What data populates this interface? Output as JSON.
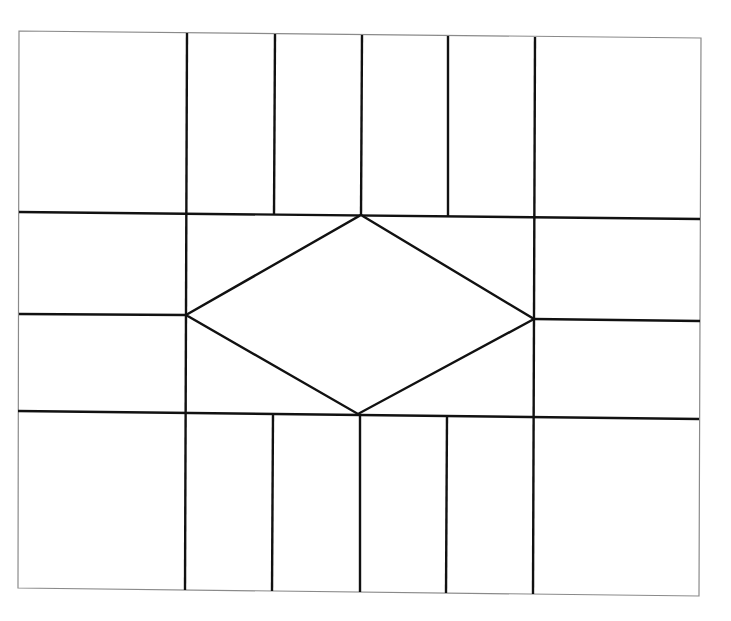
{
  "diagram": {
    "background": "#ffffff",
    "line_color": "#111111",
    "frame_color": "#8a8a8a",
    "frame": {
      "points": [
        [
          19,
          31
        ],
        [
          701,
          38
        ],
        [
          699,
          596
        ],
        [
          18,
          588
        ]
      ]
    },
    "horizontal_lines": [
      {
        "name": "upper-horizontal",
        "x1": 19,
        "y1": 212,
        "x2": 700,
        "y2": 219
      },
      {
        "name": "middle-left-horizontal",
        "x1": 19,
        "y1": 314,
        "x2": 186,
        "y2": 315
      },
      {
        "name": "middle-right-horizontal",
        "x1": 534,
        "y1": 319,
        "x2": 700,
        "y2": 321
      },
      {
        "name": "lower-horizontal",
        "x1": 18,
        "y1": 411,
        "x2": 699,
        "y2": 419
      }
    ],
    "vertical_lines": [
      {
        "name": "left-outer-vertical",
        "x1": 187,
        "y1": 33,
        "x2": 185,
        "y2": 590
      },
      {
        "name": "right-outer-vertical",
        "x1": 535,
        "y1": 37,
        "x2": 533,
        "y2": 594
      },
      {
        "name": "top-vertical-1",
        "x1": 275,
        "y1": 34,
        "x2": 274,
        "y2": 214
      },
      {
        "name": "top-vertical-2",
        "x1": 362,
        "y1": 35,
        "x2": 361,
        "y2": 215
      },
      {
        "name": "top-vertical-3",
        "x1": 448,
        "y1": 36,
        "x2": 448,
        "y2": 216
      },
      {
        "name": "bottom-vertical-1",
        "x1": 273,
        "y1": 414,
        "x2": 272,
        "y2": 591
      },
      {
        "name": "bottom-vertical-2",
        "x1": 360,
        "y1": 415,
        "x2": 360,
        "y2": 592
      },
      {
        "name": "bottom-vertical-3",
        "x1": 447,
        "y1": 416,
        "x2": 446,
        "y2": 593
      }
    ],
    "diamond": {
      "top": [
        361,
        215
      ],
      "right": [
        534,
        319
      ],
      "bottom": [
        358,
        414
      ],
      "left": [
        186,
        315
      ]
    }
  }
}
